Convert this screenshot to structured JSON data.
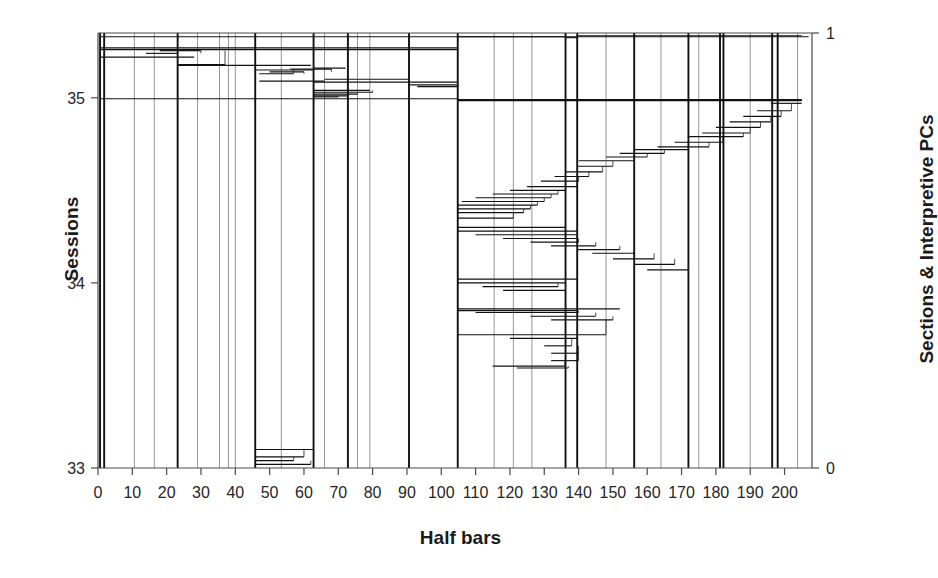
{
  "chart_data": {
    "type": "line",
    "title": "",
    "subtitle": "",
    "xlabel": "Half bars",
    "ylabel": "Sessions",
    "ylabel_right": "Sections & Interpretive PCs",
    "xlim": [
      0,
      208
    ],
    "ylim": [
      33,
      35.35
    ],
    "ylim_right": [
      0,
      1
    ],
    "xticks": [
      0,
      10,
      20,
      30,
      40,
      50,
      60,
      70,
      80,
      90,
      100,
      110,
      120,
      130,
      140,
      150,
      160,
      170,
      180,
      190,
      200
    ],
    "xticklabels": [
      "0",
      "10",
      "20",
      "30",
      "40",
      "50",
      "60",
      "70",
      "80",
      "90",
      "100",
      "110",
      "120",
      "130",
      "140",
      "150",
      "160",
      "170",
      "180",
      "190",
      "200"
    ],
    "yticks": [
      33,
      34,
      35
    ],
    "yticklabels": [
      "33",
      "34",
      "35"
    ],
    "yticks_right": [
      0,
      1
    ],
    "yticklabels_right": [
      "0",
      "1"
    ],
    "grid": false,
    "legend": "none",
    "axis_color": "#4a4a4a",
    "line_color": "#111111",
    "background": "#ffffff",
    "section_boundaries_major": [
      0.6,
      1.8,
      23.2,
      45.8,
      62.8,
      72.8,
      90.6,
      104.8,
      136.2,
      139.6,
      156.2,
      172.0,
      181.2,
      182.2,
      196.4,
      198.0
    ],
    "section_boundaries_minor": [
      10.6,
      16.4,
      29.0,
      35.4,
      38.0,
      40.0,
      53.4,
      66.0,
      75.6,
      79.2,
      115.4,
      121.0,
      126.4,
      148.0,
      164.0,
      175.0,
      190.0,
      203.8
    ],
    "series": [
      {
        "name": "Interpretive PC trace (horizontal step segments)",
        "description": "Dense stack of horizontal segments forming two descending staircases across the half-bar axis",
        "segments": [
          {
            "x0": 0.6,
            "x1": 207.0,
            "y": 35.33
          },
          {
            "x0": 0.6,
            "x1": 104.8,
            "y": 35.27
          },
          {
            "x0": 0.6,
            "x1": 104.8,
            "y": 35.26
          },
          {
            "x0": 0.6,
            "x1": 28.0,
            "y": 35.22
          },
          {
            "x0": 14.0,
            "x1": 23.2,
            "y": 35.24
          },
          {
            "x0": 18.0,
            "x1": 30.0,
            "y": 35.255
          },
          {
            "x0": 23.2,
            "x1": 37.0,
            "y": 35.18
          },
          {
            "x0": 23.2,
            "x1": 62.0,
            "y": 35.175
          },
          {
            "x0": 45.8,
            "x1": 62.8,
            "y": 35.15
          },
          {
            "x0": 47.0,
            "x1": 57.0,
            "y": 35.13
          },
          {
            "x0": 50.0,
            "x1": 60.0,
            "y": 35.14
          },
          {
            "x0": 56.0,
            "x1": 68.0,
            "y": 35.155
          },
          {
            "x0": 62.8,
            "x1": 72.0,
            "y": 35.16
          },
          {
            "x0": 66.0,
            "x1": 90.6,
            "y": 35.1
          },
          {
            "x0": 47.0,
            "x1": 66.0,
            "y": 35.09
          },
          {
            "x0": 62.8,
            "x1": 104.8,
            "y": 35.085
          },
          {
            "x0": 90.6,
            "x1": 104.8,
            "y": 35.07
          },
          {
            "x0": 93.0,
            "x1": 104.8,
            "y": 35.06
          },
          {
            "x0": 62.8,
            "x1": 79.2,
            "y": 35.04
          },
          {
            "x0": 62.8,
            "x1": 80.0,
            "y": 35.03
          },
          {
            "x0": 62.8,
            "x1": 75.6,
            "y": 35.02
          },
          {
            "x0": 62.8,
            "x1": 73.0,
            "y": 35.01
          },
          {
            "x0": 62.8,
            "x1": 70.0,
            "y": 35.005
          },
          {
            "x0": 0.6,
            "x1": 104.8,
            "y": 34.995
          },
          {
            "x0": 104.8,
            "x1": 205.0,
            "y": 34.99
          },
          {
            "x0": 104.8,
            "x1": 205.0,
            "y": 34.985
          },
          {
            "x0": 104.8,
            "x1": 136.2,
            "y": 35.33
          },
          {
            "x0": 136.2,
            "x1": 139.6,
            "y": 35.325
          },
          {
            "x0": 139.6,
            "x1": 205.0,
            "y": 35.335
          },
          {
            "x0": 196.0,
            "x1": 205.0,
            "y": 34.97
          },
          {
            "x0": 192.0,
            "x1": 202.0,
            "y": 34.93
          },
          {
            "x0": 188.0,
            "x1": 199.0,
            "y": 34.9
          },
          {
            "x0": 184.0,
            "x1": 196.0,
            "y": 34.87
          },
          {
            "x0": 180.0,
            "x1": 193.0,
            "y": 34.84
          },
          {
            "x0": 176.0,
            "x1": 190.0,
            "y": 34.81
          },
          {
            "x0": 172.0,
            "x1": 188.0,
            "y": 34.79
          },
          {
            "x0": 168.0,
            "x1": 182.0,
            "y": 34.76
          },
          {
            "x0": 163.0,
            "x1": 178.0,
            "y": 34.735
          },
          {
            "x0": 156.2,
            "x1": 172.0,
            "y": 34.72
          },
          {
            "x0": 152.0,
            "x1": 165.0,
            "y": 34.7
          },
          {
            "x0": 148.0,
            "x1": 160.0,
            "y": 34.68
          },
          {
            "x0": 140.0,
            "x1": 156.2,
            "y": 34.66
          },
          {
            "x0": 139.6,
            "x1": 150.0,
            "y": 34.63
          },
          {
            "x0": 136.2,
            "x1": 147.0,
            "y": 34.6
          },
          {
            "x0": 133.0,
            "x1": 143.0,
            "y": 34.575
          },
          {
            "x0": 129.0,
            "x1": 140.0,
            "y": 34.55
          },
          {
            "x0": 125.0,
            "x1": 139.6,
            "y": 34.52
          },
          {
            "x0": 120.0,
            "x1": 136.2,
            "y": 34.5
          },
          {
            "x0": 115.0,
            "x1": 134.0,
            "y": 34.48
          },
          {
            "x0": 110.0,
            "x1": 132.0,
            "y": 34.46
          },
          {
            "x0": 106.0,
            "x1": 130.0,
            "y": 34.44
          },
          {
            "x0": 104.8,
            "x1": 128.0,
            "y": 34.42
          },
          {
            "x0": 104.8,
            "x1": 126.0,
            "y": 34.4
          },
          {
            "x0": 104.8,
            "x1": 124.0,
            "y": 34.38
          },
          {
            "x0": 104.8,
            "x1": 121.0,
            "y": 34.35
          },
          {
            "x0": 104.8,
            "x1": 136.2,
            "y": 34.3
          },
          {
            "x0": 104.8,
            "x1": 139.6,
            "y": 34.28
          },
          {
            "x0": 110.0,
            "x1": 139.6,
            "y": 34.26
          },
          {
            "x0": 118.0,
            "x1": 139.6,
            "y": 34.24
          },
          {
            "x0": 126.0,
            "x1": 140.0,
            "y": 34.22
          },
          {
            "x0": 132.0,
            "x1": 145.0,
            "y": 34.2
          },
          {
            "x0": 139.6,
            "x1": 152.0,
            "y": 34.18
          },
          {
            "x0": 144.0,
            "x1": 156.2,
            "y": 34.16
          },
          {
            "x0": 150.0,
            "x1": 162.0,
            "y": 34.13
          },
          {
            "x0": 156.2,
            "x1": 168.0,
            "y": 34.1
          },
          {
            "x0": 160.0,
            "x1": 172.0,
            "y": 34.07
          },
          {
            "x0": 104.8,
            "x1": 139.6,
            "y": 34.02
          },
          {
            "x0": 104.8,
            "x1": 136.2,
            "y": 34.0
          },
          {
            "x0": 112.0,
            "x1": 134.0,
            "y": 33.98
          },
          {
            "x0": 118.0,
            "x1": 136.2,
            "y": 33.96
          },
          {
            "x0": 104.8,
            "x1": 152.0,
            "y": 33.86
          },
          {
            "x0": 104.8,
            "x1": 139.6,
            "y": 33.85
          },
          {
            "x0": 110.0,
            "x1": 140.0,
            "y": 33.84
          },
          {
            "x0": 126.0,
            "x1": 145.0,
            "y": 33.82
          },
          {
            "x0": 132.0,
            "x1": 150.0,
            "y": 33.8
          },
          {
            "x0": 104.8,
            "x1": 148.0,
            "y": 33.72
          },
          {
            "x0": 120.0,
            "x1": 139.6,
            "y": 33.7
          },
          {
            "x0": 130.0,
            "x1": 138.0,
            "y": 33.66
          },
          {
            "x0": 132.0,
            "x1": 140.0,
            "y": 33.62
          },
          {
            "x0": 132.0,
            "x1": 140.0,
            "y": 33.58
          },
          {
            "x0": 115.0,
            "x1": 136.0,
            "y": 33.55
          },
          {
            "x0": 122.0,
            "x1": 137.0,
            "y": 33.54
          },
          {
            "x0": 45.8,
            "x1": 62.8,
            "y": 33.1
          },
          {
            "x0": 45.8,
            "x1": 60.0,
            "y": 33.06
          },
          {
            "x0": 46.0,
            "x1": 57.0,
            "y": 33.04
          },
          {
            "x0": 46.0,
            "x1": 62.0,
            "y": 33.02
          }
        ]
      }
    ]
  },
  "axes": {
    "left": {
      "label": "Sessions",
      "ticks": [
        "35",
        "34",
        "33"
      ]
    },
    "right": {
      "label": "Sections & Interpretive PCs",
      "ticks": [
        "1",
        "0"
      ]
    },
    "bottom": {
      "label": "Half bars",
      "ticks": [
        "0",
        "10",
        "20",
        "30",
        "40",
        "50",
        "60",
        "70",
        "80",
        "90",
        "100",
        "110",
        "120",
        "130",
        "140",
        "150",
        "160",
        "170",
        "180",
        "190",
        "200"
      ]
    }
  }
}
